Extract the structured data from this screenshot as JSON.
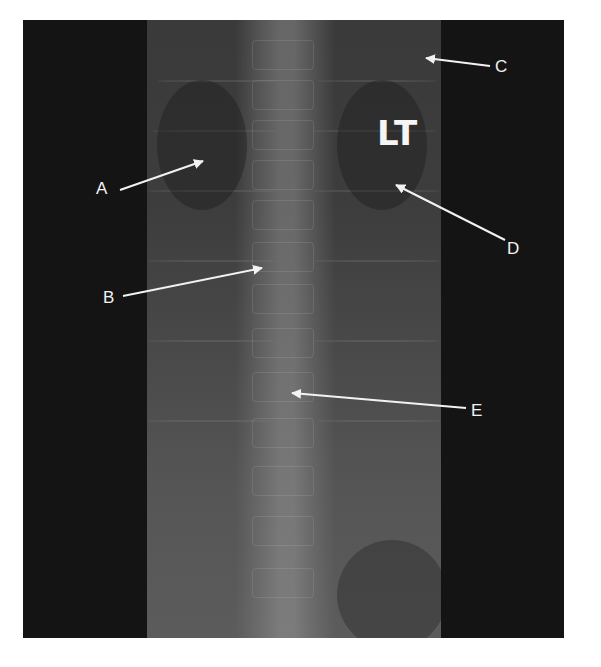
{
  "image": {
    "description": "Frontal chest/upper abdominal radiograph (X-ray) with the spine centered, overlaid with lettered arrow annotations",
    "side_marker": "LT",
    "colors": {
      "background": "#ffffff",
      "frame": "#141414",
      "xray_tissue": "#444444",
      "annotation": "#f2f2f2"
    }
  },
  "annotations": [
    {
      "id": "A",
      "label": "A",
      "label_pos": [
        103,
        188
      ],
      "arrow_from": [
        120,
        190
      ],
      "arrow_to": [
        203,
        161
      ]
    },
    {
      "id": "B",
      "label": "B",
      "label_pos": [
        110,
        297
      ],
      "arrow_from": [
        123,
        296
      ],
      "arrow_to": [
        262,
        268
      ]
    },
    {
      "id": "C",
      "label": "C",
      "label_pos": [
        502,
        66
      ],
      "arrow_from": [
        490,
        66
      ],
      "arrow_to": [
        426,
        58
      ]
    },
    {
      "id": "D",
      "label": "D",
      "label_pos": [
        514,
        248
      ],
      "arrow_from": [
        505,
        240
      ],
      "arrow_to": [
        396,
        185
      ]
    },
    {
      "id": "E",
      "label": "E",
      "label_pos": [
        477,
        410
      ],
      "arrow_from": [
        466,
        408
      ],
      "arrow_to": [
        292,
        393
      ]
    }
  ]
}
